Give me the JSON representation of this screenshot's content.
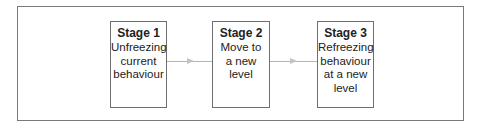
{
  "diagram": {
    "stages": [
      {
        "title": "Stage 1",
        "lines": [
          "Unfreezing",
          "current",
          "behaviour"
        ]
      },
      {
        "title": "Stage 2",
        "lines": [
          "Move to",
          "a new",
          "level"
        ]
      },
      {
        "title": "Stage 3",
        "lines": [
          "Refreezing",
          "behaviour",
          "at a new",
          "level"
        ]
      }
    ],
    "colors": {
      "border": "#6e6e6e",
      "arrow": "#b5b5b5",
      "text": "#222222"
    }
  }
}
